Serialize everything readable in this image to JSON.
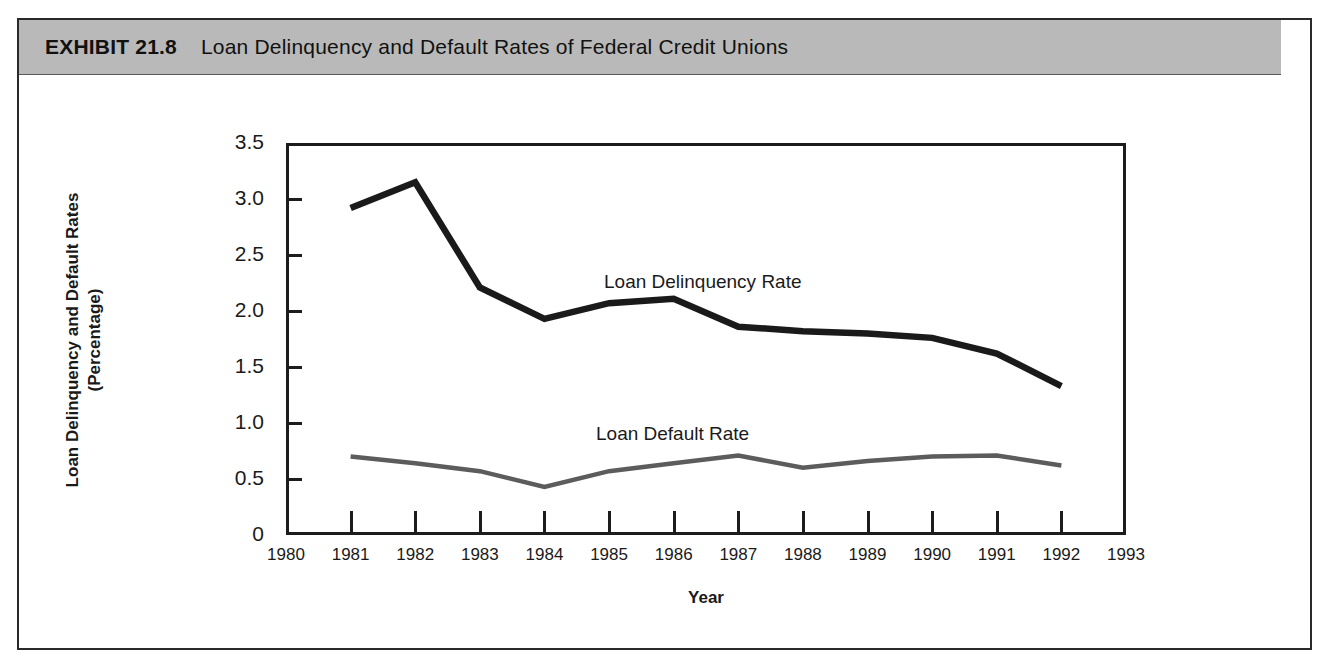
{
  "exhibit": {
    "number": "EXHIBIT 21.8",
    "title": "Loan Delinquency and Default Rates of Federal Credit Unions"
  },
  "axes": {
    "y_title_line1": "Loan Delinquency and Default Rates",
    "y_title_line2": "(Percentage)",
    "x_title": "Year"
  },
  "colors": {
    "header_band": "#b9b9b9",
    "frame": "#1c1c1c",
    "delinquency_line": "#1a1a1a",
    "default_line": "#5c5c5c",
    "page_background": "#ffffff"
  },
  "chart_data": {
    "type": "line",
    "title": "Loan Delinquency and Default Rates of Federal Credit Unions",
    "xlabel": "Year",
    "ylabel": "Loan Delinquency and Default Rates (Percentage)",
    "xlim": [
      1980,
      1993
    ],
    "ylim": [
      0,
      3.5
    ],
    "grid": false,
    "legend": "inline-annotations",
    "x_tick_labels": [
      "1980",
      "1981",
      "1982",
      "1983",
      "1984",
      "1985",
      "1986",
      "1987",
      "1988",
      "1989",
      "1990",
      "1991",
      "1992",
      "1993"
    ],
    "y_tick_labels": [
      "0",
      "0.5",
      "1.0",
      "1.5",
      "2.0",
      "2.5",
      "3.0",
      "3.5"
    ],
    "y_tick_values": [
      0,
      0.5,
      1.0,
      1.5,
      2.0,
      2.5,
      3.0,
      3.5
    ],
    "x": [
      1981,
      1982,
      1983,
      1984,
      1985,
      1986,
      1987,
      1988,
      1989,
      1990,
      1991,
      1992
    ],
    "series": [
      {
        "name": "Loan Delinquency Rate",
        "values": [
          2.92,
          3.15,
          2.21,
          1.93,
          2.07,
          2.11,
          1.86,
          1.82,
          1.8,
          1.76,
          1.62,
          1.33
        ]
      },
      {
        "name": "Loan Default Rate",
        "values": [
          0.7,
          0.64,
          0.57,
          0.43,
          0.57,
          0.64,
          0.71,
          0.6,
          0.66,
          0.7,
          0.71,
          0.62
        ]
      }
    ]
  }
}
